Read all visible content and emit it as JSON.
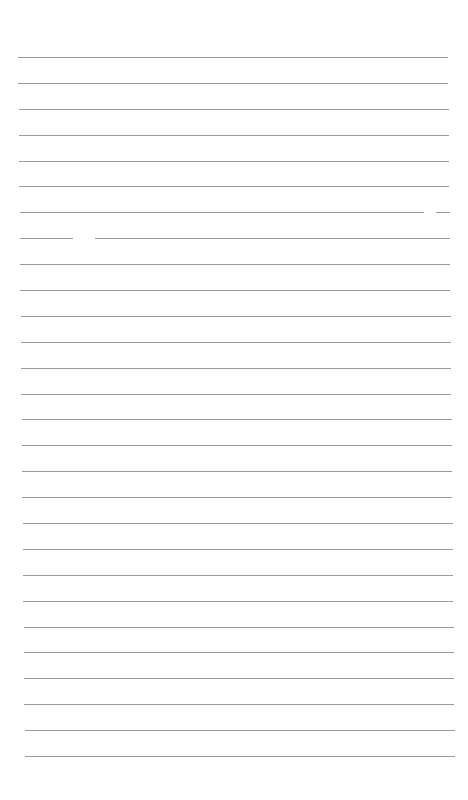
{
  "page": {
    "type": "lined-paper",
    "background": "#ffffff",
    "line_color": "#8a8a8a",
    "line_count": 28,
    "first_line_y": 57,
    "last_line_y": 756,
    "left_top": 18,
    "right_top": 448,
    "left_bottom": 25,
    "right_bottom": 455
  }
}
